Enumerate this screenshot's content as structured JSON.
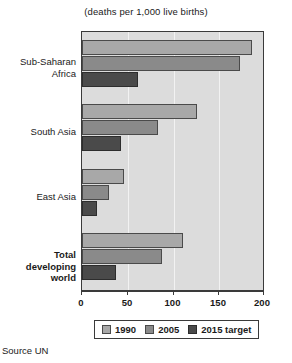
{
  "chart_data": {
    "type": "bar",
    "orientation": "horizontal",
    "title": "(deaths per 1,000 live births)",
    "xlabel": "",
    "ylabel": "",
    "xlim": [
      0,
      200
    ],
    "ticks": [
      0,
      50,
      100,
      150,
      200
    ],
    "grid": true,
    "legend_position": "bottom",
    "categories": [
      "Sub-Saharan Africa",
      "South Asia",
      "East Asia",
      "Total developing world"
    ],
    "series": [
      {
        "name": "1990",
        "color": "#a8a8a8",
        "values": [
          186,
          126,
          46,
          110
        ]
      },
      {
        "name": "2005",
        "color": "#8a8a8a",
        "values": [
          173,
          83,
          30,
          87
        ]
      },
      {
        "name": "2015 target",
        "color": "#4a4a4a",
        "values": [
          61,
          43,
          16,
          37
        ]
      }
    ]
  },
  "labels": {
    "cat_0_line_1": "Sub-Saharan",
    "cat_0_line_2": "Africa",
    "cat_1_line_1": "South Asia",
    "cat_2_line_1": "East Asia",
    "cat_3_line_1": "Total",
    "cat_3_line_2": "developing",
    "cat_3_line_3": "world"
  },
  "ticks": {
    "t0": "0",
    "t1": "50",
    "t2": "100",
    "t3": "150",
    "t4": "200"
  },
  "legend": {
    "item_0": "1990",
    "item_1": "2005",
    "item_2": "2015 target"
  },
  "source": "Source UN"
}
